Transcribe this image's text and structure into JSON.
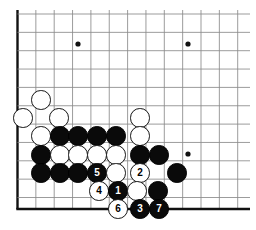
{
  "diagram": {
    "board": {
      "line_color": "#8a8a8a",
      "edge_color": "#111111",
      "background_color": "#ffffff",
      "origin_x": 17.5,
      "origin_y": 14.0,
      "spacing": 18.35,
      "cols": 14,
      "rows": 11,
      "stone_diameter": 19.5,
      "edge_left_x": 17.5,
      "edge_bottom_y": 209.0,
      "star_points": [
        {
          "x": 78,
          "y": 44
        },
        {
          "x": 188,
          "y": 44
        },
        {
          "x": 188,
          "y": 154
        }
      ]
    },
    "stones": [
      {
        "id": "w-a",
        "color": "white",
        "label": "",
        "x": 41,
        "y": 100
      },
      {
        "id": "w-b",
        "color": "white",
        "label": "",
        "x": 23,
        "y": 118
      },
      {
        "id": "w-c",
        "color": "white",
        "label": "",
        "x": 59,
        "y": 118
      },
      {
        "id": "w-d",
        "color": "white",
        "label": "",
        "x": 140,
        "y": 118
      },
      {
        "id": "w-e",
        "color": "white",
        "label": "",
        "x": 41,
        "y": 136
      },
      {
        "id": "b-a",
        "color": "black",
        "label": "",
        "x": 60,
        "y": 136
      },
      {
        "id": "b-b",
        "color": "black",
        "label": "",
        "x": 78,
        "y": 136
      },
      {
        "id": "b-c",
        "color": "black",
        "label": "",
        "x": 97,
        "y": 136
      },
      {
        "id": "b-d",
        "color": "black",
        "label": "",
        "x": 116,
        "y": 136
      },
      {
        "id": "w-f",
        "color": "white",
        "label": "",
        "x": 140,
        "y": 136
      },
      {
        "id": "b-e",
        "color": "black",
        "label": "",
        "x": 41,
        "y": 155
      },
      {
        "id": "w-g",
        "color": "white",
        "label": "",
        "x": 60,
        "y": 155
      },
      {
        "id": "w-h",
        "color": "white",
        "label": "",
        "x": 78,
        "y": 155
      },
      {
        "id": "w-i",
        "color": "white",
        "label": "",
        "x": 97,
        "y": 155
      },
      {
        "id": "w-j",
        "color": "white",
        "label": "",
        "x": 116,
        "y": 155
      },
      {
        "id": "b-f",
        "color": "black",
        "label": "",
        "x": 140,
        "y": 155
      },
      {
        "id": "b-g",
        "color": "black",
        "label": "",
        "x": 159,
        "y": 155
      },
      {
        "id": "b-h",
        "color": "black",
        "label": "",
        "x": 41,
        "y": 173
      },
      {
        "id": "b-i",
        "color": "black",
        "label": "",
        "x": 60,
        "y": 173
      },
      {
        "id": "b-j",
        "color": "black",
        "label": "",
        "x": 78,
        "y": 173
      },
      {
        "id": "m5",
        "color": "black",
        "label": "5",
        "x": 97,
        "y": 173
      },
      {
        "id": "w-k",
        "color": "white",
        "label": "",
        "x": 116,
        "y": 173
      },
      {
        "id": "m2",
        "color": "white",
        "label": "2",
        "x": 140,
        "y": 173
      },
      {
        "id": "b-k",
        "color": "black",
        "label": "",
        "x": 177,
        "y": 173
      },
      {
        "id": "m4",
        "color": "white",
        "label": "4",
        "x": 99,
        "y": 191
      },
      {
        "id": "m1",
        "color": "black",
        "label": "1",
        "x": 118,
        "y": 191
      },
      {
        "id": "w-l",
        "color": "white",
        "label": "",
        "x": 137,
        "y": 191
      },
      {
        "id": "b-l",
        "color": "black",
        "label": "",
        "x": 158,
        "y": 191
      },
      {
        "id": "m6",
        "color": "white",
        "label": "6",
        "x": 118,
        "y": 209
      },
      {
        "id": "m3",
        "color": "black",
        "label": "3",
        "x": 140,
        "y": 209
      },
      {
        "id": "m7",
        "color": "black",
        "label": "7",
        "x": 159,
        "y": 209
      }
    ]
  }
}
